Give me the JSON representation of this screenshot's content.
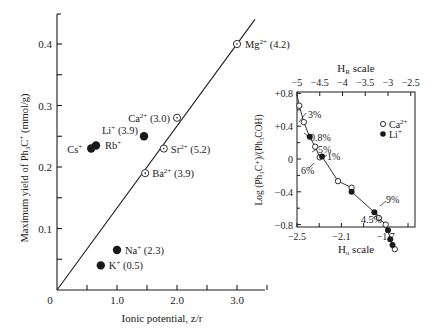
{
  "chart_data": [
    {
      "type": "scatter",
      "title": "",
      "xlabel": "Ionic potential, z/r",
      "ylabel": "Maximum yield of Ph3C+ (mmol/g)",
      "xlim": [
        0,
        3.5
      ],
      "ylim": [
        0,
        0.45
      ],
      "x_ticks": [
        "0",
        "1.0",
        "2.0",
        "3.0"
      ],
      "y_ticks": [
        "0.1",
        "0.2",
        "0.3",
        "0.4"
      ],
      "grid": false,
      "fit_line": {
        "x": [
          0,
          3.3
        ],
        "y": [
          0,
          0.44
        ]
      },
      "series": [
        {
          "name": "divalent (open circles)",
          "marker": "open-dot",
          "points": [
            {
              "label": "Mg2+ (4.2)",
              "ion": "Mg",
              "charge": "2+",
              "value": "(4.2)",
              "x": 3.0,
              "y": 0.4
            },
            {
              "label": "Ca2+ (3.0)",
              "ion": "Ca",
              "charge": "2+",
              "value": "(3.0)",
              "x": 2.0,
              "y": 0.28
            },
            {
              "label": "Sr2+ (5.2)",
              "ion": "Sr",
              "charge": "2+",
              "value": "(5.2)",
              "x": 1.78,
              "y": 0.23
            },
            {
              "label": "Ba2+ (3.9)",
              "ion": "Ba",
              "charge": "2+",
              "value": "(3.9)",
              "x": 1.47,
              "y": 0.19
            }
          ]
        },
        {
          "name": "monovalent (filled circles)",
          "marker": "filled",
          "points": [
            {
              "label": "Li+ (3.9)",
              "ion": "Li",
              "charge": "+",
              "value": "(3.9)",
              "x": 1.45,
              "y": 0.25
            },
            {
              "label": "Cs+",
              "ion": "Cs",
              "charge": "+",
              "value": "",
              "x": 0.57,
              "y": 0.23
            },
            {
              "label": "Rb+",
              "ion": "Rb",
              "charge": "+",
              "value": "",
              "x": 0.65,
              "y": 0.235
            },
            {
              "label": "Na+ (2.3)",
              "ion": "Na",
              "charge": "+",
              "value": "(2.3)",
              "x": 1.0,
              "y": 0.065
            },
            {
              "label": "K+ (0.5)",
              "ion": "K",
              "charge": "+",
              "value": "(0.5)",
              "x": 0.73,
              "y": 0.04
            }
          ]
        }
      ]
    },
    {
      "type": "scatter",
      "title": "",
      "xlabel_top": "HR scale",
      "xlabel_bottom": "Ho scale",
      "ylabel": "Log (Ph3C+)/(Ph3COH)",
      "top_ticks": [
        "-5",
        "-4.5",
        "-4",
        "-3.5",
        "-3",
        "-2.5"
      ],
      "bottom_ticks": [
        "-2.5",
        "-2.1",
        "-1.7"
      ],
      "y_ticks": [
        "+0.8",
        "+0.4",
        "0",
        "-0.4",
        "-0.8"
      ],
      "ylim": [
        -1.1,
        1.0
      ],
      "legend": [
        {
          "label": "Ca2+",
          "ion": "Ca",
          "charge": "2+",
          "marker": "open"
        },
        {
          "label": "Li+",
          "ion": "Li",
          "charge": "+",
          "marker": "filled"
        }
      ],
      "legend_position": "upper right",
      "annotations": [
        "3%",
        "0.8%",
        "5%",
        "1%",
        "6%",
        "9%",
        "4.5%"
      ],
      "series": [
        {
          "name": "Ca2+",
          "marker": "open",
          "points_HR": [
            [
              -4.95,
              0.65
            ],
            [
              -4.85,
              0.45
            ],
            [
              -4.6,
              0.15
            ],
            [
              -4.5,
              0.02
            ],
            [
              -4.1,
              -0.27
            ],
            [
              -3.8,
              -0.35
            ],
            [
              -3.2,
              -0.72
            ],
            [
              -3.05,
              -0.8
            ],
            [
              -2.85,
              -1.1
            ]
          ]
        },
        {
          "name": "Li+",
          "marker": "filled",
          "points_HR": [
            [
              -4.72,
              0.27
            ],
            [
              -4.45,
              0.03
            ],
            [
              -3.8,
              -0.4
            ],
            [
              -3.3,
              -0.65
            ],
            [
              -3.0,
              -0.87
            ],
            [
              -2.95,
              -0.98
            ],
            [
              -2.9,
              -1.05
            ]
          ]
        }
      ]
    }
  ],
  "main": {
    "y_axis_label_prefix": "Maximum yield of Ph",
    "y_axis_label_sub": "3",
    "y_axis_label_mid": "C",
    "y_axis_label_sup": "+",
    "y_axis_label_suffix": " (mmol/g)",
    "x_axis_label": "Ionic potential, z/r",
    "origin_label": "0"
  },
  "inset": {
    "top_label_main": "H",
    "top_label_sub": "R",
    "top_label_suffix": " scale",
    "bottom_label_main": "H",
    "bottom_label_sub": "o",
    "bottom_label_suffix": " scale",
    "y_label": "Log (Ph₃C⁺)/(Ph₃COH)",
    "legend_ca_ion": "Ca",
    "legend_ca_charge": "2+",
    "legend_li_ion": "Li",
    "legend_li_charge": "+"
  }
}
